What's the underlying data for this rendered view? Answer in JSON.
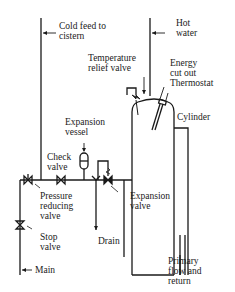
{
  "diagram": {
    "colors": {
      "line": "#1a1a1a",
      "background": "#ffffff"
    },
    "labels": {
      "cold_feed": "Cold feed to\ncistern",
      "hot_water": "Hot\nwater",
      "temperature_relief_valve": "Temperature\nrelief valve",
      "energy_cutout": "Energy\ncut out",
      "thermostat": "Thermostat",
      "cylinder": "Cylinder",
      "expansion_vessel": "Expansion\nvessel",
      "check_valve": "Check\nvalve",
      "pressure_reducing_valve": "Pressure\nreducing\nvalve",
      "stop_valve": "Stop\nvalve",
      "drain": "Drain",
      "expansion_valve": "Expansion\nvalve",
      "primary_flow_return": "Primary\nflow and\nreturn",
      "main": "Main"
    }
  }
}
